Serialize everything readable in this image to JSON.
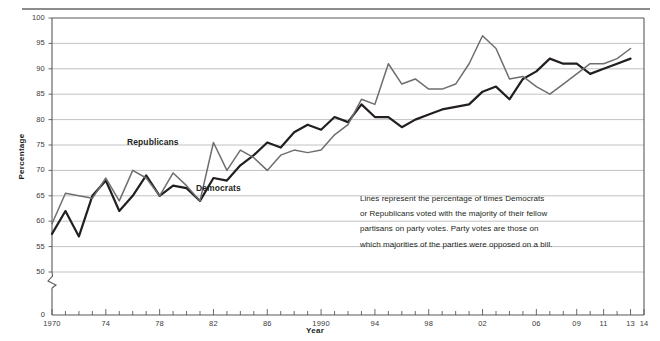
{
  "figure": {
    "top_rule_name": "top-divider-rule",
    "y_axis_title": "Percentage",
    "x_axis_title": "Year",
    "annotation_lines": [
      "Lines represent the percentage of times Democrats",
      "or Republicans voted with the majority of their fellow",
      "partisans on party votes. Party votes are those on",
      "which majorities of the parties were opposed on a bill."
    ]
  },
  "colors": {
    "democrats_line": "#231f20",
    "republicans_line": "#6e6e6e",
    "gridline": "#b3b3b3",
    "axis": "#595959",
    "rule": "#8d8d8d",
    "text": "#231f20",
    "background": "#ffffff"
  },
  "chart_data": {
    "type": "line",
    "title": "",
    "subtitle": "",
    "xlabel": "Year",
    "ylabel": "Percentage",
    "xlim": [
      1970,
      2014
    ],
    "ylim": [
      50,
      100
    ],
    "y_axis_break": true,
    "y_break_below": 50,
    "grid": true,
    "grid_axis": "y",
    "legend": "inline-labels",
    "ytick_labels": [
      "0",
      "50",
      "55",
      "60",
      "65",
      "70",
      "75",
      "80",
      "85",
      "90",
      "95",
      "100"
    ],
    "ytick_values": [
      0,
      50,
      55,
      60,
      65,
      70,
      75,
      80,
      85,
      90,
      95,
      100
    ],
    "xtick_major_years": [
      1970,
      1974,
      1978,
      1982,
      1986,
      1990,
      1994,
      1998,
      2002,
      2006,
      2009,
      2011,
      2013,
      2014
    ],
    "xtick_major_labels": [
      "1970",
      "74",
      "78",
      "82",
      "86",
      "1990",
      "94",
      "98",
      "02",
      "06",
      "09",
      "11",
      "13",
      "14"
    ],
    "x": [
      1970,
      1971,
      1972,
      1973,
      1974,
      1975,
      1976,
      1977,
      1978,
      1979,
      1980,
      1981,
      1982,
      1983,
      1984,
      1985,
      1986,
      1987,
      1988,
      1989,
      1990,
      1991,
      1992,
      1993,
      1994,
      1995,
      1996,
      1997,
      1998,
      1999,
      2000,
      2001,
      2002,
      2003,
      2004,
      2005,
      2006,
      2007,
      2008,
      2009,
      2010,
      2011,
      2012,
      2013
    ],
    "series": [
      {
        "name": "Democrats",
        "color": "#231f20",
        "label_x": 1986,
        "label_y": 68,
        "values": [
          57.5,
          62,
          57,
          65,
          68,
          62,
          65,
          69,
          65,
          67,
          66.5,
          64,
          68.5,
          68,
          71,
          73,
          75.5,
          74.5,
          77.5,
          79,
          78,
          80.5,
          79.5,
          83,
          80.5,
          80.5,
          78.5,
          80,
          81,
          82,
          82.5,
          83,
          85.5,
          86.5,
          84,
          88,
          89.5,
          92,
          91,
          91,
          89,
          90,
          91,
          92
        ]
      },
      {
        "name": "Republicans",
        "color": "#6e6e6e",
        "label_x": 1977,
        "label_y": 76,
        "values": [
          59.5,
          65.5,
          65,
          64.5,
          68.5,
          64,
          70,
          68.5,
          65,
          69.5,
          67,
          64,
          75.5,
          70,
          74,
          72.5,
          70,
          73,
          74,
          73.5,
          74,
          77,
          79,
          84,
          83,
          91,
          87,
          88,
          86,
          86,
          87,
          91,
          96.5,
          94,
          88,
          88.5,
          86.5,
          85,
          87,
          89,
          91,
          91,
          92,
          94
        ]
      }
    ]
  }
}
